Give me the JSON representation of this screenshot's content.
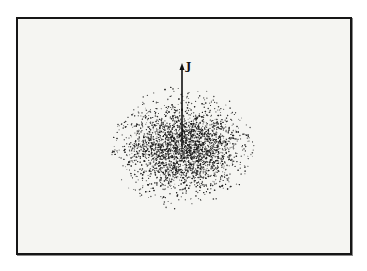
{
  "figure": {
    "vector_label": "J",
    "colors": {
      "frame_border": "#161616",
      "background": "#f5f5f2",
      "dots": "#1a1a1a",
      "arrow": "#111111"
    },
    "cloud": {
      "center_x": 183,
      "center_y": 148,
      "radius_x": 70,
      "radius_y": 60
    },
    "arrow": {
      "x": 182,
      "y_start": 146,
      "y_end": 64
    }
  }
}
